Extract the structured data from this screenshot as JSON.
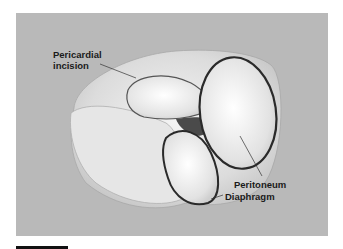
{
  "figure": {
    "background_color": "#b9b9b9",
    "labels": {
      "pericardial_line1": "Pericardial",
      "pericardial_line2": "incision",
      "peritoneum": "Peritoneum",
      "diaphragm": "Diaphragm"
    }
  }
}
